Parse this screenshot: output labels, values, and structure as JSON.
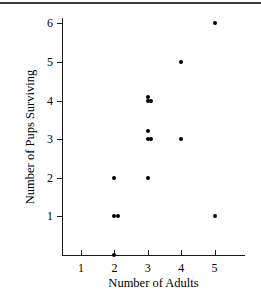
{
  "chart_data": {
    "type": "scatter",
    "title": "",
    "xlabel": "Number of Adults",
    "ylabel": "Number of Pups Surviving",
    "xlim": [
      0.5,
      5.5
    ],
    "ylim": [
      0,
      6.4
    ],
    "grid": false,
    "legend": null,
    "x_ticks": [
      1,
      2,
      3,
      4,
      5
    ],
    "x_ticklabels": [
      "1",
      "2",
      "3",
      "4",
      "5"
    ],
    "y_ticks": [
      1,
      2,
      3,
      4,
      5,
      6
    ],
    "y_ticklabels": [
      "1",
      "2",
      "3",
      "4",
      "5",
      "6"
    ],
    "marker": "filled-circle",
    "marker_color": "#000000",
    "points": [
      {
        "x": 2,
        "y": 0
      },
      {
        "x": 2,
        "y": 1
      },
      {
        "x": 2,
        "y": 1
      },
      {
        "x": 2,
        "y": 2
      },
      {
        "x": 3,
        "y": 2
      },
      {
        "x": 3,
        "y": 3
      },
      {
        "x": 3,
        "y": 3
      },
      {
        "x": 3,
        "y": 3.2
      },
      {
        "x": 3,
        "y": 4
      },
      {
        "x": 3,
        "y": 4
      },
      {
        "x": 3,
        "y": 4.1
      },
      {
        "x": 4,
        "y": 3
      },
      {
        "x": 4,
        "y": 5
      },
      {
        "x": 5,
        "y": 1
      },
      {
        "x": 5,
        "y": 6
      }
    ]
  },
  "figure": {
    "axis_color": "#1a1a1a",
    "background": "#ffffff"
  }
}
